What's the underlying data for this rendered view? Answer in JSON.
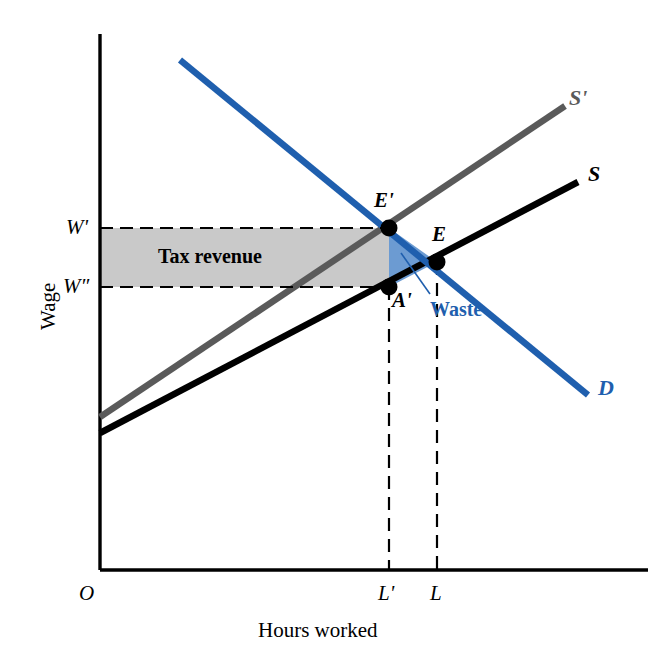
{
  "figure": {
    "kind": "economics-supply-demand-tax-diagram",
    "background_color": "#ffffff"
  },
  "axes": {
    "y_title": "Wage",
    "x_title": "Hours worked",
    "origin_label": "O",
    "axis_color": "#000000",
    "y_ticks": [
      {
        "label": "W'",
        "y_px": 228
      },
      {
        "label": "W″",
        "y_px": 287
      }
    ],
    "x_ticks": [
      {
        "label": "L'",
        "x_px": 389
      },
      {
        "label": "L",
        "x_px": 437
      }
    ]
  },
  "curves": [
    {
      "name": "supply-with-tax",
      "label": "S'",
      "color": "#5a5a5a",
      "x1": 100,
      "y1": 417,
      "x2": 565,
      "y2": 106,
      "label_x": 577,
      "label_y": 89
    },
    {
      "name": "supply",
      "label": "S",
      "color": "#000000",
      "x1": 100,
      "y1": 433,
      "x2": 578,
      "y2": 182,
      "label_x": 592,
      "label_y": 165
    },
    {
      "name": "demand",
      "label": "D",
      "color": "#1f5fae",
      "x1": 180,
      "y1": 60,
      "x2": 588,
      "y2": 395,
      "label_x": 601,
      "label_y": 379
    }
  ],
  "points": [
    {
      "name": "equilibrium-with-tax",
      "label": "E'",
      "x": 389,
      "y": 228,
      "label_x": 376,
      "label_y": 192
    },
    {
      "name": "equilibrium",
      "label": "E",
      "x": 437,
      "y": 262,
      "label_x": 434,
      "label_y": 226
    },
    {
      "name": "supply-price-point",
      "label": "A'",
      "x": 389,
      "y": 287,
      "label_x": 394,
      "label_y": 291
    }
  ],
  "regions": [
    {
      "name": "tax-revenue",
      "label": "Tax revenue",
      "fill": "#c9c9c9",
      "stroke": "#000000",
      "label_x": 160,
      "label_y": 246,
      "x": 100,
      "y": 228,
      "width": 289,
      "height": 59
    },
    {
      "name": "waste",
      "label": "Waste",
      "fill": "#6c9bd2",
      "text_color": "#1f5fae",
      "label_x": 436,
      "label_y": 299,
      "leader_x1": 430,
      "leader_y1": 294,
      "leader_x2": 401,
      "leader_y2": 253
    }
  ],
  "dashed_lines": [
    {
      "name": "w-prime-guide",
      "x1": 100,
      "y1": 228,
      "x2": 389,
      "y2": 228
    },
    {
      "name": "w-double-prime-guide",
      "x1": 100,
      "y1": 287,
      "x2": 389,
      "y2": 287
    },
    {
      "name": "l-prime-guide",
      "x1": 389,
      "y1": 287,
      "x2": 389,
      "y2": 570
    },
    {
      "name": "l-guide",
      "x1": 437,
      "y1": 262,
      "x2": 437,
      "y2": 570
    }
  ]
}
